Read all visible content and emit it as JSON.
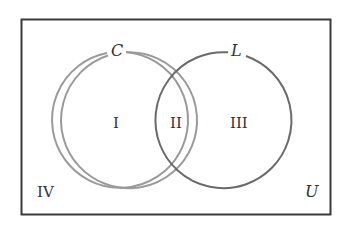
{
  "diagram": {
    "type": "venn",
    "universe": {
      "label": "U",
      "stroke": "#3a3a3a"
    },
    "sets": [
      {
        "id": "C",
        "label": "C",
        "stroke": "#9a9a9a"
      },
      {
        "id": "L",
        "label": "L",
        "stroke": "#6a6a6a"
      }
    ],
    "regions": [
      {
        "id": "I",
        "label": "I"
      },
      {
        "id": "II",
        "label": "II"
      },
      {
        "id": "III",
        "label": "III"
      },
      {
        "id": "IV",
        "label": "IV"
      }
    ]
  }
}
